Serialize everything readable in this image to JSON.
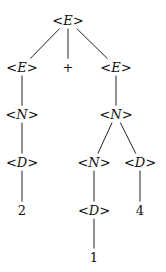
{
  "diagram": {
    "type": "parse-tree",
    "nodes": [
      {
        "id": "n0",
        "label": "<E>",
        "x": 68,
        "y": 20,
        "kind": "nonterminal"
      },
      {
        "id": "n1",
        "label": "<E>",
        "x": 22,
        "y": 67,
        "kind": "nonterminal"
      },
      {
        "id": "n2",
        "label": "+",
        "x": 68,
        "y": 67,
        "kind": "terminal"
      },
      {
        "id": "n3",
        "label": "<E>",
        "x": 116,
        "y": 67,
        "kind": "nonterminal"
      },
      {
        "id": "n4",
        "label": "<N>",
        "x": 22,
        "y": 114,
        "kind": "nonterminal"
      },
      {
        "id": "n5",
        "label": "<N>",
        "x": 116,
        "y": 114,
        "kind": "nonterminal"
      },
      {
        "id": "n6",
        "label": "<D>",
        "x": 22,
        "y": 162,
        "kind": "nonterminal"
      },
      {
        "id": "n7",
        "label": "<N>",
        "x": 94,
        "y": 162,
        "kind": "nonterminal"
      },
      {
        "id": "n8",
        "label": "<D>",
        "x": 140,
        "y": 162,
        "kind": "nonterminal"
      },
      {
        "id": "n9",
        "label": "2",
        "x": 22,
        "y": 210,
        "kind": "terminal"
      },
      {
        "id": "n10",
        "label": "<D>",
        "x": 94,
        "y": 210,
        "kind": "nonterminal"
      },
      {
        "id": "n11",
        "label": "4",
        "x": 140,
        "y": 210,
        "kind": "terminal"
      },
      {
        "id": "n12",
        "label": "1",
        "x": 94,
        "y": 257,
        "kind": "terminal"
      }
    ],
    "edges": [
      [
        "n0",
        "n1"
      ],
      [
        "n0",
        "n2"
      ],
      [
        "n0",
        "n3"
      ],
      [
        "n1",
        "n4"
      ],
      [
        "n3",
        "n5"
      ],
      [
        "n4",
        "n6"
      ],
      [
        "n5",
        "n7"
      ],
      [
        "n5",
        "n8"
      ],
      [
        "n6",
        "n9"
      ],
      [
        "n7",
        "n10"
      ],
      [
        "n8",
        "n11"
      ],
      [
        "n10",
        "n12"
      ]
    ]
  }
}
